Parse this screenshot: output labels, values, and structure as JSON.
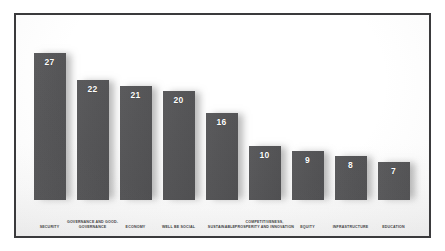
{
  "chart_data": {
    "type": "bar",
    "title": "",
    "subtitle": "",
    "xlabel": "",
    "ylabel": "",
    "ylim": [
      0,
      27
    ],
    "grid": false,
    "legend": false,
    "orientation": "vertical",
    "bar_color": "#545456",
    "value_label_color": "#ffffff",
    "category_label_color": "#3c3c3e",
    "background_color": "#ffffff",
    "border_color": "#3a3a3c",
    "categories": [
      "SECURITY",
      "GOVERNANCE AND GOOD-GOVERNANCE",
      "ECONOMY",
      "WELL BE SOCIAL",
      "SUSTAINABLE",
      "COMPETITIVENESS, PROSPERITY AND INNOVATION",
      "EQUITY",
      "INFRASTRUCTURE",
      "EDUCATION"
    ],
    "values": [
      27,
      22,
      21,
      20,
      16,
      10,
      9,
      8,
      7
    ],
    "bars": [
      {
        "category": "SECURITY",
        "value": 27,
        "value_label": "27"
      },
      {
        "category": "GOVERNANCE AND GOOD-GOVERNANCE",
        "value": 22,
        "value_label": "22"
      },
      {
        "category": "ECONOMY",
        "value": 21,
        "value_label": "21"
      },
      {
        "category": "WELL BE SOCIAL",
        "value": 20,
        "value_label": "20"
      },
      {
        "category": "SUSTAINABLE",
        "value": 16,
        "value_label": "16"
      },
      {
        "category": "COMPETITIVENESS, PROSPERITY AND INNOVATION",
        "value": 10,
        "value_label": "10"
      },
      {
        "category": "EQUITY",
        "value": 9,
        "value_label": "9"
      },
      {
        "category": "INFRASTRUCTURE",
        "value": 8,
        "value_label": "8"
      },
      {
        "category": "EDUCATION",
        "value": 7,
        "value_label": "7"
      }
    ]
  }
}
